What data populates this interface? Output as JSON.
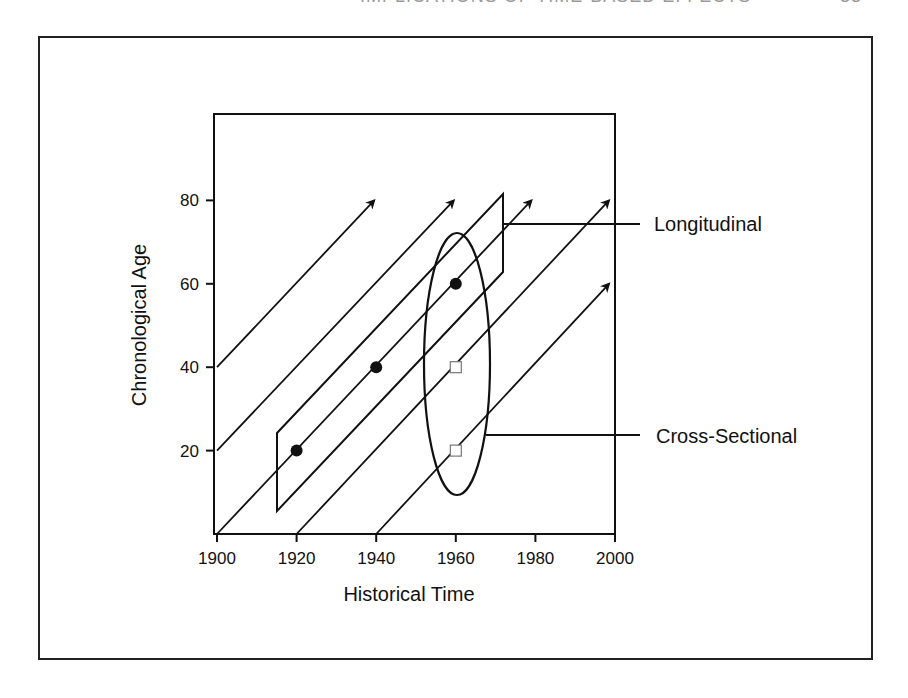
{
  "header": {
    "running_title": "IMPLICATIONS OF TIME-BASED EFFECTS",
    "page_number": "33"
  },
  "chart_data": {
    "type": "diagram",
    "title": "",
    "xlabel": "Historical Time",
    "ylabel": "Chronological Age",
    "xlim": [
      1900,
      2000
    ],
    "ylim": [
      0,
      100
    ],
    "x_ticks": [
      1900,
      1920,
      1940,
      1960,
      1980,
      2000
    ],
    "y_ticks": [
      20,
      40,
      60,
      80
    ],
    "grid": false,
    "cohort_lines": [
      {
        "start": [
          1900,
          40
        ],
        "end": [
          1939.5,
          80
        ],
        "arrow": true
      },
      {
        "start": [
          1900,
          20
        ],
        "end": [
          1959.5,
          80
        ],
        "arrow": true
      },
      {
        "start": [
          1900,
          0
        ],
        "end": [
          1979,
          80
        ],
        "arrow": true
      },
      {
        "start": [
          1920,
          0
        ],
        "end": [
          1998.5,
          80
        ],
        "arrow": true
      },
      {
        "start": [
          1940,
          0
        ],
        "end": [
          1998.5,
          60
        ],
        "arrow": true
      }
    ],
    "longitudinal_points": [
      {
        "x": 1920,
        "y": 20,
        "marker": "filled-circle"
      },
      {
        "x": 1940,
        "y": 40,
        "marker": "filled-circle"
      },
      {
        "x": 1960,
        "y": 60,
        "marker": "filled-circle"
      }
    ],
    "cross_sectional_points": [
      {
        "x": 1960,
        "y": 20,
        "marker": "open-square"
      },
      {
        "x": 1960,
        "y": 40,
        "marker": "open-square"
      },
      {
        "x": 1960,
        "y": 60,
        "marker": "filled-circle"
      }
    ],
    "annotations": [
      {
        "label": "Longitudinal",
        "shape": "parallelogram",
        "text_position": [
          655,
          224
        ]
      },
      {
        "label": "Cross-Sectional",
        "shape": "ellipse",
        "text_position": [
          655,
          436
        ]
      }
    ]
  },
  "labels": {
    "longitudinal": "Longitudinal",
    "cross_sectional": "Cross-Sectional",
    "xlabel": "Historical Time",
    "ylabel": "Chronological Age",
    "x_ticks": [
      "1900",
      "1920",
      "1940",
      "1960",
      "1980",
      "2000"
    ],
    "y_ticks": [
      "20",
      "40",
      "60",
      "80"
    ]
  }
}
